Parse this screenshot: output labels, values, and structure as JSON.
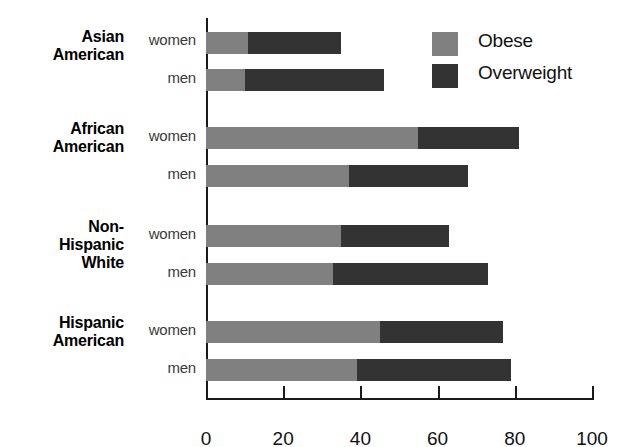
{
  "chart_data": {
    "type": "bar",
    "orientation": "horizontal",
    "stacked": true,
    "title": "",
    "xlabel": "",
    "ylabel": "",
    "xlim": [
      0,
      100
    ],
    "xticks": [
      0,
      20,
      40,
      60,
      80,
      100
    ],
    "xtick_labels": [
      "0",
      "20",
      "40",
      "60",
      "80",
      "100"
    ],
    "grid": false,
    "legend_position": "top-right",
    "series": [
      {
        "name": "Obese",
        "color": "#808080"
      },
      {
        "name": "Overweight",
        "color": "#333333"
      }
    ],
    "groups": [
      {
        "label_lines": [
          "Asian",
          "American"
        ],
        "rows": [
          {
            "label": "women",
            "obese": 11,
            "overweight": 24,
            "total": 35
          },
          {
            "label": "men",
            "obese": 10,
            "overweight": 36,
            "total": 46
          }
        ]
      },
      {
        "label_lines": [
          "African",
          "American"
        ],
        "rows": [
          {
            "label": "women",
            "obese": 55,
            "overweight": 26,
            "total": 81
          },
          {
            "label": "men",
            "obese": 37,
            "overweight": 31,
            "total": 68
          }
        ]
      },
      {
        "label_lines": [
          "Non-",
          "Hispanic",
          "White"
        ],
        "rows": [
          {
            "label": "women",
            "obese": 35,
            "overweight": 28,
            "total": 63
          },
          {
            "label": "men",
            "obese": 33,
            "overweight": 40,
            "total": 73
          }
        ]
      },
      {
        "label_lines": [
          "Hispanic",
          "American"
        ],
        "rows": [
          {
            "label": "women",
            "obese": 45,
            "overweight": 32,
            "total": 77
          },
          {
            "label": "men",
            "obese": 39,
            "overweight": 40,
            "total": 79
          }
        ]
      }
    ]
  },
  "legend": {
    "items": [
      {
        "label": "Obese",
        "color": "#808080",
        "swatch_name": "legend-swatch-obese"
      },
      {
        "label": "Overweight",
        "color": "#333333",
        "swatch_name": "legend-swatch-overweight"
      }
    ]
  },
  "layout": {
    "group_label_tops": [
      28,
      120,
      218,
      314
    ],
    "series_label_tops": [
      31,
      69,
      127,
      165,
      225,
      263,
      321,
      359
    ],
    "bar_tops": [
      32,
      69,
      127,
      165,
      225,
      263,
      321,
      359
    ],
    "px_per_unit": 3.86,
    "plot_left": 206,
    "plot_top": 18
  }
}
